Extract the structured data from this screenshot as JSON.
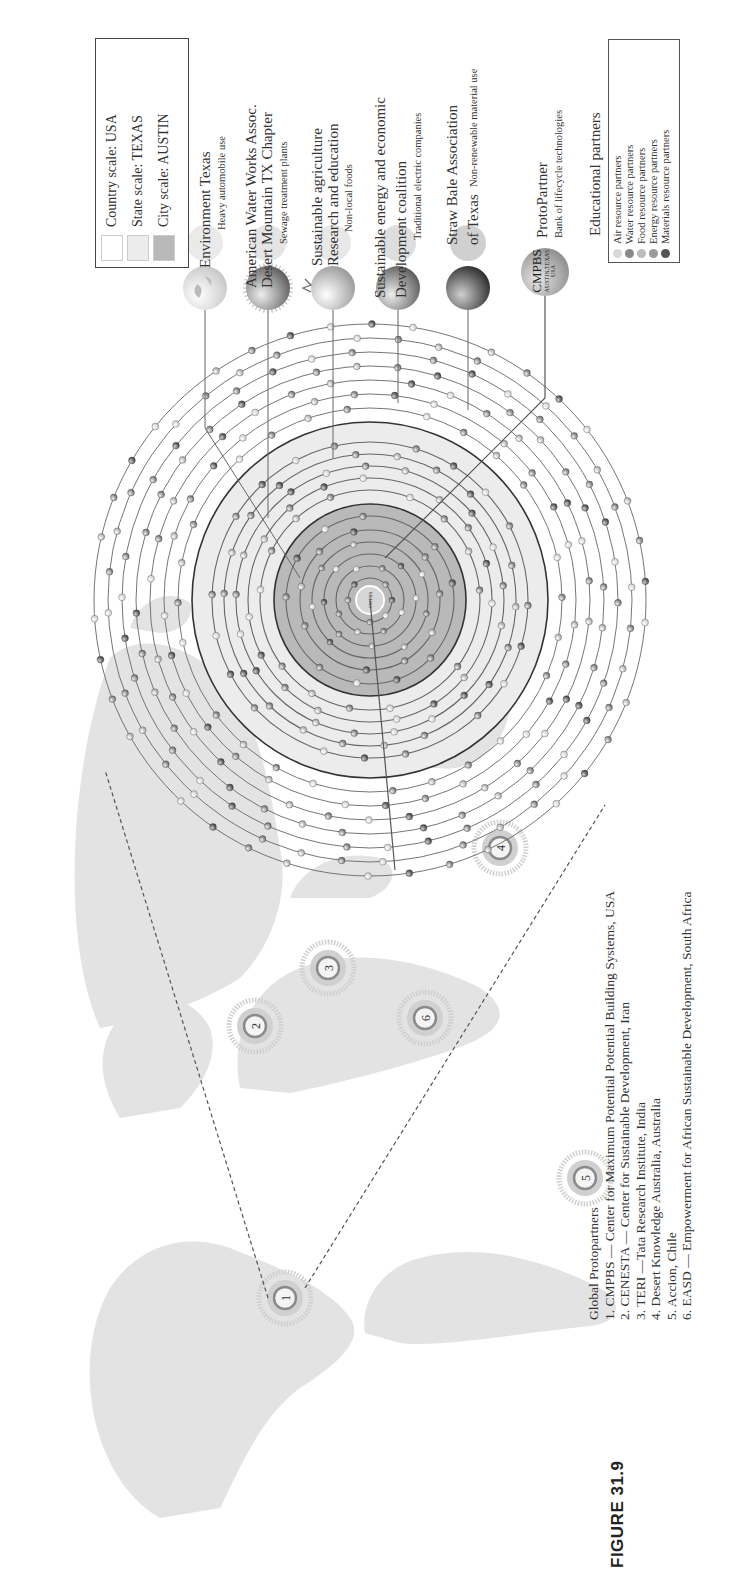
{
  "figure": {
    "label": "FIGURE 31.9"
  },
  "scale_legend": {
    "items": [
      {
        "label": "Country scale:  USA",
        "color": "#ffffff"
      },
      {
        "label": "State scale:  TEXAS",
        "color": "#ececec"
      },
      {
        "label": "City scale:  AUSTIN",
        "color": "#b9b9b9"
      }
    ]
  },
  "partners": [
    {
      "name_lines": [
        "Environment Texas"
      ],
      "sub": "Heavy automobile use",
      "sphere": "globe"
    },
    {
      "name_lines": [
        "American Water Works Assoc.",
        "Desert Mountain TX Chapter"
      ],
      "sub": "Sewage treatment plants",
      "sphere": "fuzzy"
    },
    {
      "name_lines": [
        "Sustainable agriculture",
        "Research and education"
      ],
      "sub": "Non-local foods",
      "sphere": "tomato"
    },
    {
      "name_lines": [
        "Sustainable energy and economic",
        "Development coalition"
      ],
      "sub": "Traditional electric companies",
      "sphere": "medium"
    },
    {
      "name_lines": [
        "Straw Bale Association",
        "of Texas"
      ],
      "sub": "Non-renewable material use",
      "sphere": "dark"
    },
    {
      "name_lines": [
        "ProtoPartner"
      ],
      "sub": "Bank of lifecycle technologies",
      "sphere": "cmpbs"
    }
  ],
  "cmpbs_badge": {
    "title": "CMPBS",
    "line2": "AUSTIN,TEXAS",
    "line3": "USA"
  },
  "educational_legend": {
    "title": "Educational partners",
    "items": [
      {
        "label": "Air resource partners",
        "color": "#d8d8d8"
      },
      {
        "label": "Water resource partners",
        "color": "#8a8a8a"
      },
      {
        "label": "Food resource partners",
        "color": "#bdbdbd"
      },
      {
        "label": "Energy resource partners",
        "color": "#9a9a9a"
      },
      {
        "label": "Materials resource partners",
        "color": "#555555"
      }
    ]
  },
  "global_protopartners": {
    "title": "Global Protopartners",
    "items": [
      "1. CMPBS — Center for Maximum Potential Potential Building Systems, USA",
      "2. CENESTA — Center for Sustainable Development, Iran",
      "3. TERI —Tata Research Institute, India",
      "4. Desert Knowledge Australia, Australia",
      "5. Accion, Chile",
      "6. EASD — Empowerment for African Sustainable Development, South Africa"
    ]
  },
  "map_markers": [
    {
      "n": "1",
      "u": 290,
      "v": 285
    },
    {
      "n": "2",
      "u": 562,
      "v": 255
    },
    {
      "n": "3",
      "u": 620,
      "v": 328
    },
    {
      "n": "4",
      "u": 740,
      "v": 500
    },
    {
      "n": "5",
      "u": 410,
      "v": 585
    },
    {
      "n": "6",
      "u": 570,
      "v": 425
    }
  ],
  "chart_data": {
    "type": "diagram",
    "center": "CMPBS AUSTIN,TEXAS USA",
    "scales": [
      "Country scale: USA",
      "State scale: TEXAS",
      "City scale: AUSTIN"
    ],
    "ring_count": 14,
    "partner_categories": [
      "Air resource partners",
      "Water resource partners",
      "Food resource partners",
      "Energy resource partners",
      "Materials resource partners"
    ],
    "global_protopartners": [
      "CMPBS (USA)",
      "CENESTA (Iran)",
      "TERI (India)",
      "Desert Knowledge Australia (Australia)",
      "Accion (Chile)",
      "EASD (South Africa)"
    ]
  }
}
